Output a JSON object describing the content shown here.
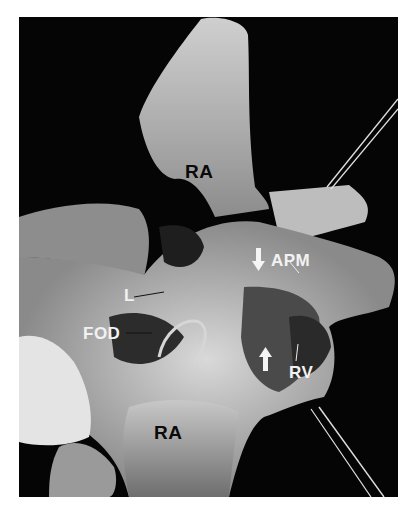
{
  "figure": {
    "colors": {
      "background": "#050505",
      "tissue_light": "#d8d8d8",
      "tissue_mid": "#8a8a8a",
      "tissue_dark": "#2a2a2a",
      "label_dark": "#0a0a0a",
      "label_light": "#f2f2f2"
    },
    "labels": [
      {
        "id": "ra-top",
        "text": "RA",
        "x": 167,
        "y": 153,
        "tone": "dark"
      },
      {
        "id": "apm",
        "text": "APM",
        "x": 276,
        "y": 251,
        "tone": "light"
      },
      {
        "id": "l",
        "text": "L",
        "x": 123,
        "y": 289,
        "tone": "light"
      },
      {
        "id": "fod",
        "text": "FOD",
        "x": 82,
        "y": 325,
        "tone": "light"
      },
      {
        "id": "rv",
        "text": "RV",
        "x": 293,
        "y": 353,
        "tone": "light"
      },
      {
        "id": "ra-bottom",
        "text": "RA",
        "x": 151,
        "y": 414,
        "tone": "dark"
      }
    ],
    "arrows": [
      {
        "id": "arrow-down",
        "direction": "down",
        "x": 259,
        "y": 248
      },
      {
        "id": "arrow-up",
        "direction": "up",
        "x": 266,
        "y": 350
      }
    ]
  }
}
